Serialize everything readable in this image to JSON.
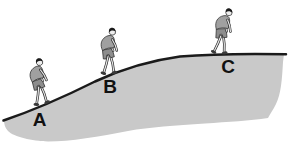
{
  "diagram": {
    "positions": [
      {
        "label": "A"
      },
      {
        "label": "B"
      },
      {
        "label": "C"
      }
    ],
    "colors": {
      "background": "#ffffff",
      "hill_fill": "#c9c9c9",
      "surface_line": "#1b1b1b",
      "label_text": "#111111",
      "shirt": "#a0a0a0",
      "shorts": "#8d8d8d",
      "hair": "#1a1a1a",
      "skin": "#ededed",
      "limb_outline": "#2a2a2a",
      "shoe": "#3a3a3a"
    }
  }
}
